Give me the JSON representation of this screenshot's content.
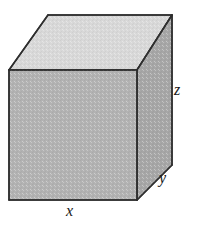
{
  "figure": {
    "type": "geometric-diagram",
    "shape_name": "rectangular-box",
    "background_color": "#ffffff",
    "projection": "oblique",
    "faces": {
      "top": {
        "name": "top-face",
        "fill": "#d8d8d8",
        "stroke": "#3a3a3a",
        "points": "9,70 48,15 172,15 137,70"
      },
      "front": {
        "name": "front-face",
        "fill": "#b2b2b2",
        "stroke": "#3a3a3a",
        "points": "9,70 137,70 137,200 9,200"
      },
      "right": {
        "name": "right-face",
        "fill": "#a6a6a6",
        "stroke": "#3a3a3a",
        "points": "137,70 172,15 172,165 137,200"
      }
    },
    "edges": {
      "stroke": "#2e2e2e",
      "stroke_width": 1.6
    },
    "labels": [
      {
        "id": "x",
        "text": "x",
        "meaning": "width-of-box",
        "position": "bottom-center"
      },
      {
        "id": "y",
        "text": "y",
        "meaning": "depth-of-box",
        "position": "lower-right"
      },
      {
        "id": "z",
        "text": "z",
        "meaning": "height-of-box",
        "position": "right"
      }
    ]
  }
}
